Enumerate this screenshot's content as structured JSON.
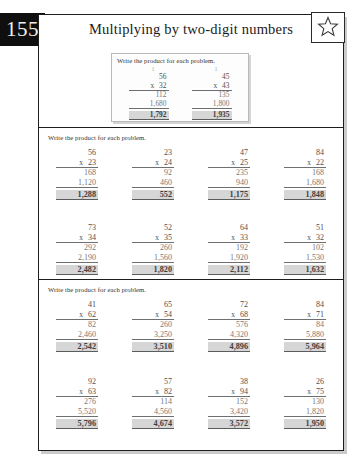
{
  "page_number": "155",
  "header": {
    "title": "Multiplying by two-digit numbers",
    "star_icon": "star-outline-icon"
  },
  "instruction": "Write the product for each problem.",
  "example": {
    "instruction": "Write the product for each problem.",
    "problems": [
      {
        "carry": "1",
        "top": "56",
        "op": "x",
        "bottom": "32",
        "partials": [
          "112",
          "1,680"
        ],
        "answer": "1,792"
      },
      {
        "carry": "1",
        "top": "45",
        "op": "x",
        "bottom": "43",
        "partials": [
          "135",
          "1,800"
        ],
        "answer": "1,935"
      }
    ]
  },
  "sections": [
    {
      "instruction": "Write the product for each problem.",
      "rows": [
        [
          {
            "top": "56",
            "op": "x",
            "bottom": "23",
            "partials": [
              "168",
              "1,120"
            ],
            "answer": "1,288"
          },
          {
            "top": "23",
            "op": "x",
            "bottom": "24",
            "partials": [
              "92",
              "460"
            ],
            "answer": "552"
          },
          {
            "top": "47",
            "op": "x",
            "bottom": "25",
            "partials": [
              "235",
              "940"
            ],
            "answer": "1,175"
          },
          {
            "top": "84",
            "op": "x",
            "bottom": "22",
            "partials": [
              "168",
              "1,680"
            ],
            "answer": "1,848"
          }
        ],
        [
          {
            "top": "73",
            "op": "x",
            "bottom": "34",
            "partials": [
              "292",
              "2,190"
            ],
            "answer": "2,482"
          },
          {
            "top": "52",
            "op": "x",
            "bottom": "35",
            "partials": [
              "260",
              "1,560"
            ],
            "answer": "1,820"
          },
          {
            "top": "64",
            "op": "x",
            "bottom": "33",
            "partials": [
              "192",
              "1,920"
            ],
            "answer": "2,112"
          },
          {
            "top": "51",
            "op": "x",
            "bottom": "32",
            "partials": [
              "102",
              "1,530"
            ],
            "answer": "1,632"
          }
        ]
      ]
    },
    {
      "instruction": "Write the product for each problem.",
      "rows": [
        [
          {
            "top": "41",
            "op": "x",
            "bottom": "62",
            "partials": [
              "82",
              "2,460"
            ],
            "answer": "2,542"
          },
          {
            "top": "65",
            "op": "x",
            "bottom": "54",
            "partials": [
              "260",
              "3,250"
            ],
            "answer": "3,510"
          },
          {
            "top": "72",
            "op": "x",
            "bottom": "68",
            "partials": [
              "576",
              "4,320"
            ],
            "answer": "4,896"
          },
          {
            "top": "84",
            "op": "x",
            "bottom": "71",
            "partials": [
              "84",
              "5,880"
            ],
            "answer": "5,964"
          }
        ],
        [
          {
            "top": "92",
            "op": "x",
            "bottom": "63",
            "partials": [
              "276",
              "5,520"
            ],
            "answer": "5,796"
          },
          {
            "top": "57",
            "op": "x",
            "bottom": "82",
            "partials": [
              "114",
              "4,560"
            ],
            "answer": "4,674"
          },
          {
            "top": "38",
            "op": "x",
            "bottom": "94",
            "partials": [
              "152",
              "3,420"
            ],
            "answer": "3,572"
          },
          {
            "top": "26",
            "op": "x",
            "bottom": "75",
            "partials": [
              "130",
              "1,820"
            ],
            "answer": "1,950"
          }
        ]
      ]
    }
  ],
  "colors": {
    "badge_bg": "#100f0f",
    "frame": "#1d1d1d",
    "answer_highlight": "#d6d6d6",
    "digit": "#57595b"
  }
}
